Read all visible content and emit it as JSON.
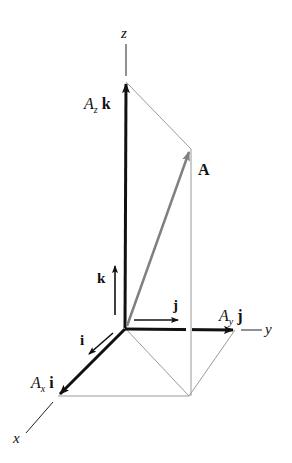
{
  "figure": {
    "axes": {
      "x": "x",
      "y": "y",
      "z": "z"
    },
    "vector": {
      "name": "A"
    },
    "unit_vectors": {
      "i": "i",
      "j": "j",
      "k": "k"
    },
    "components": {
      "ax": {
        "A": "A",
        "sub": "x",
        "unit": "i"
      },
      "ay": {
        "A": "A",
        "sub": "y",
        "unit": "j"
      },
      "az": {
        "A": "A",
        "sub": "z",
        "unit": "k"
      }
    },
    "colors": {
      "axis": "#111111",
      "vector_A": "#808080",
      "construction": "#9a9a9a"
    }
  }
}
